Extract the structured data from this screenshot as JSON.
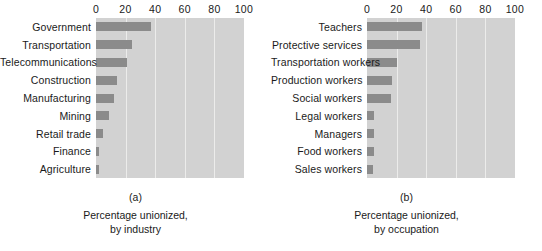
{
  "chart_data": [
    {
      "type": "bar",
      "orientation": "horizontal",
      "panel_tag": "(a)",
      "title": "",
      "caption_line1": "Percentage unionized,",
      "caption_line2": "by industry",
      "xlabel": "",
      "ylabel": "",
      "categories": [
        "Government",
        "Transportation",
        "Telecommunications",
        "Construction",
        "Manufacturing",
        "Mining",
        "Retail trade",
        "Finance",
        "Agriculture"
      ],
      "values": [
        37,
        24,
        21,
        14,
        12,
        9,
        5,
        2,
        2
      ],
      "xticks": [
        0,
        20,
        40,
        60,
        80,
        100
      ],
      "xlim": [
        0,
        100
      ],
      "grid": true,
      "legend": "none",
      "bar_color": "#8b8b8b",
      "plot_background": "#d2d2d2",
      "gridline_color": "#ececeb"
    },
    {
      "type": "bar",
      "orientation": "horizontal",
      "panel_tag": "(b)",
      "title": "",
      "caption_line1": "Percentage unionized,",
      "caption_line2": "by occupation",
      "xlabel": "",
      "ylabel": "",
      "categories": [
        "Teachers",
        "Protective services",
        "Transportation workers",
        "Production workers",
        "Social workers",
        "Legal workers",
        "Managers",
        "Food workers",
        "Sales workers"
      ],
      "values": [
        37,
        36,
        20,
        17,
        16,
        5,
        5,
        5,
        4
      ],
      "xticks": [
        0,
        20,
        40,
        60,
        80,
        100
      ],
      "xlim": [
        0,
        100
      ],
      "grid": true,
      "legend": "none",
      "bar_color": "#8b8b8b",
      "plot_background": "#d2d2d2",
      "gridline_color": "#ececeb"
    }
  ]
}
